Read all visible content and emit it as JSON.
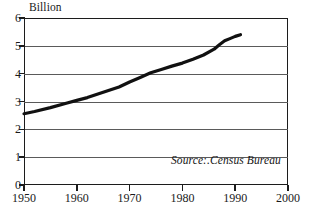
{
  "chart_data": {
    "type": "line",
    "title": "",
    "subtitle": "",
    "xlabel": "",
    "ylabel": "Billion",
    "unit_caption": "Billion",
    "xlim": [
      1950,
      2000
    ],
    "ylim": [
      0,
      6
    ],
    "grid": "horizontal",
    "legend": "none",
    "annotations": [
      {
        "name": "source-note",
        "text": "Source:.Census Bureau"
      }
    ],
    "xticks": [
      1950,
      1960,
      1970,
      1980,
      1990,
      2000
    ],
    "xtick_labels": [
      "1950",
      "1960",
      "1970",
      "1980",
      "1990",
      "2000"
    ],
    "yticks": [
      0,
      1,
      2,
      3,
      4,
      5,
      6
    ],
    "ytick_labels": [
      "0",
      "1",
      "2",
      "3",
      "4",
      "5",
      "6"
    ],
    "series": [
      {
        "name": "World population",
        "color": "#111111",
        "line_width": 3.2,
        "x": [
          1950,
          1952,
          1955,
          1958,
          1960,
          1962,
          1965,
          1968,
          1970,
          1972,
          1974,
          1976,
          1978,
          1980,
          1982,
          1984,
          1986,
          1987,
          1988,
          1989,
          1990,
          1991
        ],
        "values": [
          2.56,
          2.64,
          2.78,
          2.94,
          3.04,
          3.14,
          3.33,
          3.52,
          3.7,
          3.86,
          4.03,
          4.15,
          4.27,
          4.38,
          4.52,
          4.67,
          4.88,
          5.04,
          5.18,
          5.26,
          5.34,
          5.4
        ]
      }
    ]
  }
}
